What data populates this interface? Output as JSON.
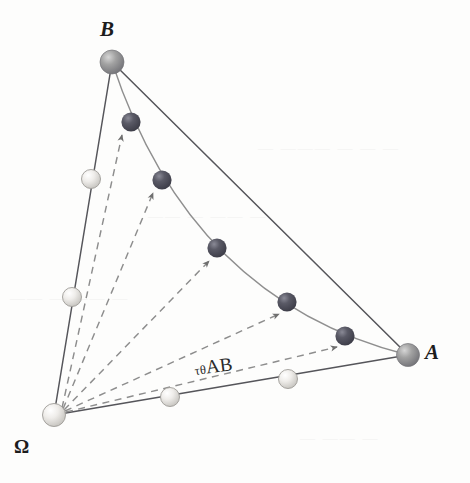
{
  "figure": {
    "width": 470,
    "height": 483,
    "background_color": "#fdfdfc"
  },
  "labels": {
    "vertex_b": "B",
    "vertex_a": "A",
    "vertex_omega": "Ω",
    "transport_operator": "τθ",
    "transport_args": "AB",
    "transport_full": "τθAB"
  },
  "colors": {
    "dark_sphere": "#4a4a55",
    "dark_sphere_highlight": "#7c7c88",
    "light_sphere": "#e4e2dd",
    "light_sphere_highlight": "#fbfbfa",
    "mid_sphere": "#9b9b9b",
    "mid_sphere_highlight": "#cfcfcf",
    "line": "#55555a",
    "curve": "#8a8a8a",
    "dashed": "#8d8d8d",
    "text": "#1c1c1c"
  },
  "geometry": {
    "vertices": [
      {
        "name": "Omega",
        "x": 54,
        "y": 415,
        "r": 11.5,
        "shade": "light"
      },
      {
        "name": "B",
        "x": 112,
        "y": 62,
        "r": 12.0,
        "shade": "mid"
      },
      {
        "name": "A",
        "x": 408,
        "y": 355,
        "r": 11.5,
        "shade": "mid"
      }
    ],
    "edge_omega_b_points": [
      {
        "x": 91,
        "y": 179,
        "r": 9.5,
        "shade": "light"
      },
      {
        "x": 72,
        "y": 297,
        "r": 9.5,
        "shade": "light"
      }
    ],
    "edge_omega_a_points": [
      {
        "x": 170,
        "y": 397,
        "r": 9.5,
        "shade": "light"
      },
      {
        "x": 288,
        "y": 379,
        "r": 9.5,
        "shade": "light"
      }
    ],
    "curve_points": [
      {
        "x": 131,
        "y": 122,
        "r": 9.5,
        "shade": "dark"
      },
      {
        "x": 162,
        "y": 180,
        "r": 9.5,
        "shade": "dark"
      },
      {
        "x": 217,
        "y": 248,
        "r": 9.5,
        "shade": "dark"
      },
      {
        "x": 287,
        "y": 302,
        "r": 9.5,
        "shade": "dark"
      },
      {
        "x": 345,
        "y": 336,
        "r": 9.5,
        "shade": "dark"
      }
    ],
    "chord": {
      "from": "B",
      "to": "A"
    },
    "curve_control": {
      "cx": 190,
      "cy": 300
    },
    "arrow_count": 5,
    "arrow_origin": {
      "x": 54,
      "y": 415
    }
  },
  "background_artifacts": [
    {
      "text": "— ——— — — —",
      "x": 258,
      "y": 140
    },
    {
      "text": "—— — ——  —",
      "x": 148,
      "y": 208
    },
    {
      "text": "—— —  —— —",
      "x": 10,
      "y": 290
    },
    {
      "text": "— —— —",
      "x": 300,
      "y": 430
    }
  ]
}
